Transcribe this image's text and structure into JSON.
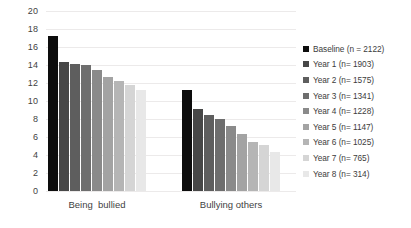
{
  "chart_data": {
    "type": "bar",
    "title": "",
    "xlabel": "",
    "ylabel": "",
    "ylim": [
      0,
      20
    ],
    "ytick_step": 2,
    "yticks": [
      "0",
      "2",
      "4",
      "6",
      "8",
      "10",
      "12",
      "14",
      "16",
      "18",
      "20"
    ],
    "grid": true,
    "legend_position": "right",
    "categories": [
      "Being  bullied",
      "Bullying others"
    ],
    "series": [
      {
        "name": "Baseline (n = 2122)",
        "color": "#0d0d0d",
        "values": [
          17.2,
          11.2
        ]
      },
      {
        "name": "Year 1 (n= 1903)",
        "color": "#474747",
        "values": [
          14.3,
          9.1
        ]
      },
      {
        "name": "Year 2 (n= 1575)",
        "color": "#5e5e5e",
        "values": [
          14.15,
          8.4
        ]
      },
      {
        "name": "Year 3 (n= 1341)",
        "color": "#6e6e6e",
        "values": [
          14.05,
          8.0
        ]
      },
      {
        "name": "Year 4 (n= 1228)",
        "color": "#8a8a8a",
        "values": [
          13.4,
          7.2
        ]
      },
      {
        "name": "Year 5 (n= 1147)",
        "color": "#a3a3a3",
        "values": [
          12.65,
          6.3
        ]
      },
      {
        "name": "Year 6 (n= 1025)",
        "color": "#b5b5b5",
        "values": [
          12.2,
          5.4
        ]
      },
      {
        "name": "Year 7 (n= 765)",
        "color": "#d5d5d5",
        "values": [
          11.8,
          5.1
        ]
      },
      {
        "name": "Year 8 (n= 314)",
        "color": "#e8e8e8",
        "values": [
          11.2,
          4.3
        ]
      }
    ]
  }
}
